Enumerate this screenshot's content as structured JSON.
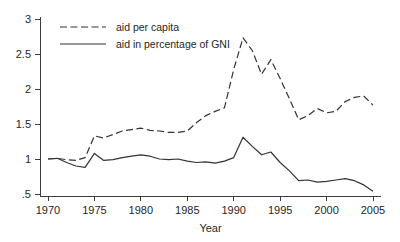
{
  "chart_data": {
    "type": "line",
    "title": "",
    "xlabel": "Year",
    "ylabel": "",
    "xlim": [
      1970,
      2005
    ],
    "ylim": [
      0.5,
      3.0
    ],
    "grid": false,
    "legend_position": "top-left",
    "xticks": [
      1970,
      1975,
      1980,
      1985,
      1990,
      1995,
      2000,
      2005
    ],
    "xtick_labels": [
      "1970",
      "1975",
      "1980",
      "1985",
      "1990",
      "1995",
      "2000",
      "2005"
    ],
    "yticks": [
      0.5,
      1.0,
      1.5,
      2.0,
      2.5,
      3.0
    ],
    "ytick_labels": [
      ".5",
      "1",
      "1.5",
      "2",
      "2.5",
      "3"
    ],
    "x": [
      1970,
      1971,
      1972,
      1973,
      1974,
      1975,
      1976,
      1977,
      1978,
      1979,
      1980,
      1981,
      1982,
      1983,
      1984,
      1985,
      1986,
      1987,
      1988,
      1989,
      1990,
      1991,
      1992,
      1993,
      1994,
      1995,
      1996,
      1997,
      1998,
      1999,
      2000,
      2001,
      2002,
      2003,
      2004,
      2005
    ],
    "series": [
      {
        "name": "aid per capita",
        "style": "dashed",
        "color": "#333333",
        "values": [
          1.0,
          1.01,
          0.99,
          0.98,
          1.02,
          1.33,
          1.3,
          1.35,
          1.4,
          1.42,
          1.44,
          1.41,
          1.4,
          1.38,
          1.38,
          1.4,
          1.52,
          1.62,
          1.68,
          1.73,
          2.28,
          2.73,
          2.55,
          2.21,
          2.42,
          2.15,
          1.86,
          1.56,
          1.62,
          1.72,
          1.66,
          1.68,
          1.82,
          1.88,
          1.9,
          1.77
        ]
      },
      {
        "name": "aid in percentage of GNI",
        "style": "solid",
        "color": "#333333",
        "values": [
          1.0,
          1.01,
          0.95,
          0.9,
          0.88,
          1.08,
          0.98,
          0.99,
          1.02,
          1.04,
          1.06,
          1.04,
          1.0,
          0.99,
          1.0,
          0.97,
          0.95,
          0.96,
          0.94,
          0.97,
          1.02,
          1.31,
          1.18,
          1.06,
          1.1,
          0.95,
          0.83,
          0.69,
          0.7,
          0.67,
          0.68,
          0.7,
          0.72,
          0.69,
          0.63,
          0.54
        ]
      }
    ]
  },
  "legend": {
    "entries": [
      {
        "label": "aid per capita",
        "style": "dashed"
      },
      {
        "label": "aid in percentage of GNI",
        "style": "solid"
      }
    ]
  },
  "axis": {
    "x_title": "Year"
  }
}
